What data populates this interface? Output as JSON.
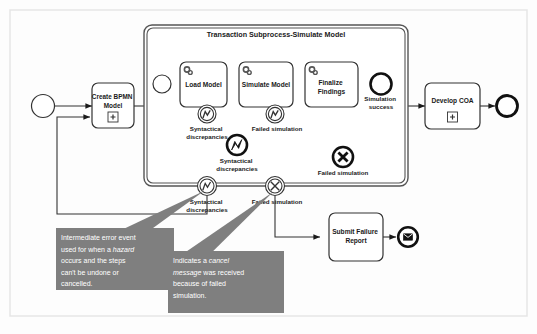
{
  "diagram": {
    "type": "bpmn-process-diagram",
    "background_color": "#fdfdfd",
    "frame_border_color": "#e3e3e3",
    "stroke_color": "#1a1a1a",
    "callout_fill": "#7f7f7f",
    "callout_text_color": "#ffffff"
  },
  "subprocess": {
    "title": "Transaction Subprocess-Simulate Model"
  },
  "tasks": {
    "create_bpmn_model": "Create BPMN Model",
    "load_model": "Load Model",
    "simulate_model": "Simulate Model",
    "finalize_findings": "Finalize Findings",
    "develop_coa": "Develop COA",
    "submit_failure_report": "Submit Failure Report"
  },
  "markers": {
    "subprocess_expand": "+",
    "service_task": "gear-icon"
  },
  "events": {
    "start_event": "start-event",
    "subprocess_start_event": "subprocess-start-event",
    "simulation_success": "Simulation success",
    "boundary_load_model_error": "Syntactical discrepancies",
    "boundary_simulate_model_error": "Failed simulation",
    "end_error_syntactical": "Syntactical discrepancies",
    "end_cancel_failed": "Failed simulation",
    "boundary_subprocess_error": "Syntactical discrepancies",
    "boundary_subprocess_cancel": "Failed simulation",
    "develop_coa_end": "end-event",
    "submit_failure_report_end": "message-end-event"
  },
  "callouts": [
    {
      "id": "callout-error-event",
      "lines": [
        {
          "text": "Intermediate error event",
          "italic": false
        },
        {
          "text": "used for when a ",
          "italic": false,
          "emph": "hazard"
        },
        {
          "text": "occurs and the steps",
          "italic": false
        },
        {
          "text": "can't be undone or",
          "italic": false
        },
        {
          "text": "cancelled.",
          "italic": false
        }
      ]
    },
    {
      "id": "callout-cancel-event",
      "lines": [
        {
          "text": "Indicates a ",
          "italic": false,
          "emph": "cancel"
        },
        {
          "text": "message",
          "italic": true,
          "tail": " was received"
        },
        {
          "text": "because of failed",
          "italic": false
        },
        {
          "text": "simulation.",
          "italic": false
        }
      ]
    }
  ],
  "callout_text": {
    "c1_l1": "Intermediate error event",
    "c1_l2a": "used for when a ",
    "c1_l2b": "hazard",
    "c1_l3": "occurs and the steps",
    "c1_l4": "can't be undone or",
    "c1_l5": "cancelled.",
    "c2_l1a": "Indicates a ",
    "c2_l1b": "cancel",
    "c2_l2a": "message",
    "c2_l2b": " was received",
    "c2_l3": "because of failed",
    "c2_l4": "simulation."
  }
}
